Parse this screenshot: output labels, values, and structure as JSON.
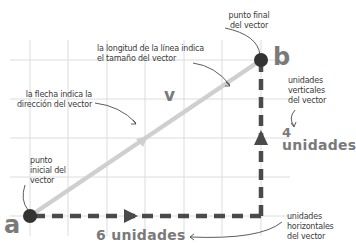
{
  "diagram": {
    "point_start_letter": "a",
    "point_end_letter": "b",
    "vector_letter": "v",
    "labels": {
      "start_point": "punto inicial del vector",
      "start_point_lines": [
        "punto",
        "inicial del",
        "vector"
      ],
      "end_point_lines": [
        "punto final",
        "del vector"
      ],
      "length_note_lines": [
        "la longitud de la línea indica",
        "el tamaño del vector"
      ],
      "direction_note_lines": [
        "la flecha indica la",
        "dirección del vector"
      ],
      "vertical_units_lines": [
        "unidades",
        "verticales",
        "del vector"
      ],
      "horizontal_units_lines": [
        "unidades",
        "horizontales",
        "del vector"
      ]
    },
    "vertical_count_number": "4",
    "vertical_count_word": "unidades",
    "horizontal_count": "6 unidades",
    "horizontal_units": 6,
    "vertical_units": 4,
    "colors": {
      "grid": "#d9d9d9",
      "vector": "#cfcfcf",
      "components": "#4a4a4a",
      "points": "#333333",
      "big_text": "#7a7a7a",
      "label_text": "#3a3a3a"
    }
  }
}
